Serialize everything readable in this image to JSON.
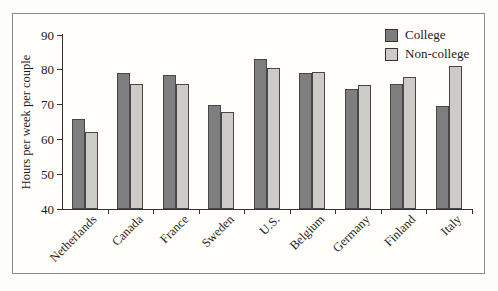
{
  "figure": {
    "background": "#fffefa",
    "frame_border_color": "#8a8a8a",
    "text_color": "#1c1c1c"
  },
  "chart_data": {
    "type": "bar",
    "title": "",
    "ylabel": "Hours per week per couple",
    "xlabel": "",
    "ylim": [
      40,
      90
    ],
    "yticks": [
      40,
      50,
      60,
      70,
      80,
      90
    ],
    "grid": false,
    "legend_position": "top-right",
    "bar_border_color": "#474747",
    "categories": [
      "Netherlands",
      "Canada",
      "France",
      "Sweden",
      "U.S.",
      "Belgium",
      "Germany",
      "Finland",
      "Italy"
    ],
    "series": [
      {
        "name": "College",
        "color": "#7e7e7e",
        "values": [
          66,
          79,
          78.5,
          70,
          83,
          79,
          74.5,
          76,
          69.5
        ]
      },
      {
        "name": "Non-college",
        "color": "#cccbc8",
        "values": [
          62,
          76,
          76,
          68,
          80.5,
          79.5,
          75.5,
          78,
          81
        ]
      }
    ]
  }
}
